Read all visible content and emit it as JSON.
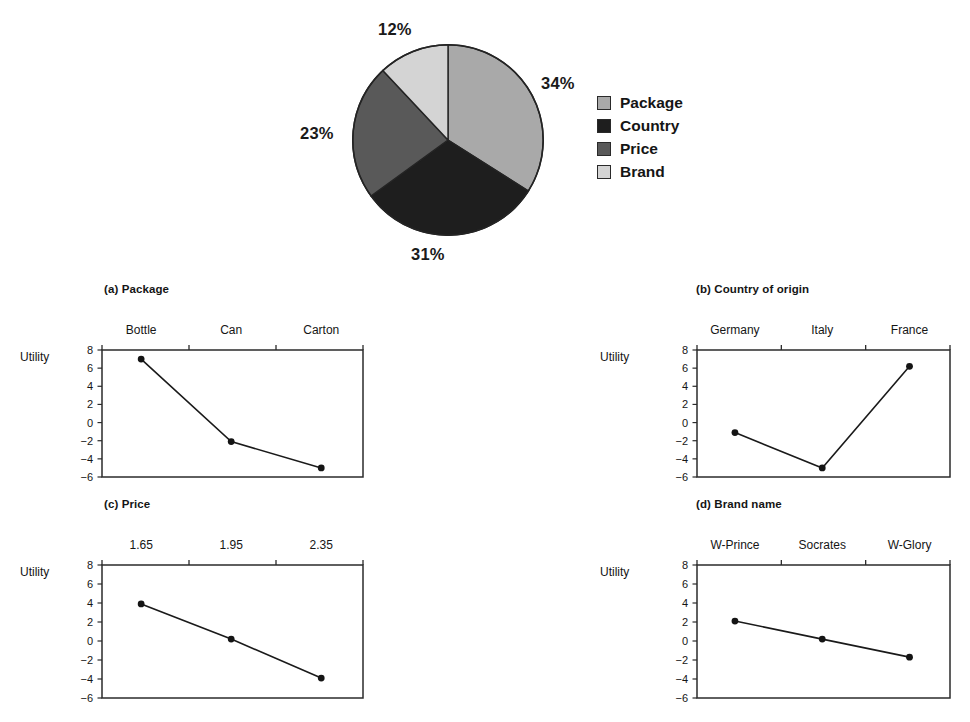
{
  "figure": {
    "pie_labels": {
      "package": "34%",
      "country": "31%",
      "price": "23%",
      "brand": "12%"
    },
    "legend": [
      {
        "label": "Package",
        "color": "#a9a9a9",
        "swatch_name": "legend-swatch-package"
      },
      {
        "label": "Country",
        "color": "#1e1e1e",
        "swatch_name": "legend-swatch-country"
      },
      {
        "label": "Price",
        "color": "#595959",
        "swatch_name": "legend-swatch-price"
      },
      {
        "label": "Brand",
        "color": "#d4d4d4",
        "swatch_name": "legend-swatch-brand"
      }
    ],
    "panels": {
      "a": {
        "title": "(a) Package",
        "ylabel": "Utility",
        "cats": [
          "Bottle",
          "Can",
          "Carton"
        ]
      },
      "b": {
        "title": "(b) Country of origin",
        "ylabel": "Utility",
        "cats": [
          "Germany",
          "Italy",
          "France"
        ]
      },
      "c": {
        "title": "(c) Price",
        "ylabel": "Utility",
        "cats": [
          "1.65",
          "1.95",
          "2.35"
        ]
      },
      "d": {
        "title": "(d) Brand name",
        "ylabel": "Utility",
        "cats": [
          "W-Prince",
          "Socrates",
          "W-Glory"
        ]
      }
    },
    "yticks": [
      "8",
      "6",
      "4",
      "2",
      "0",
      "-2",
      "-4",
      "-6"
    ]
  },
  "chart_data": [
    {
      "type": "pie",
      "title": "",
      "labels": [
        "Package",
        "Country",
        "Price",
        "Brand"
      ],
      "values": [
        34,
        31,
        23,
        12
      ],
      "value_labels": [
        "34%",
        "31%",
        "23%",
        "12%"
      ],
      "unit": "percent relative importance",
      "colors": [
        "#a9a9a9",
        "#1e1e1e",
        "#595959",
        "#d4d4d4"
      ],
      "start_angle_deg": 90,
      "direction": "clockwise",
      "legend_position": "right",
      "grid": false
    },
    {
      "type": "line",
      "title": "(a) Package",
      "xlabel": "",
      "ylabel": "Utility",
      "categories": [
        "Bottle",
        "Can",
        "Carton"
      ],
      "values": [
        7.0,
        -2.1,
        -5.0
      ],
      "ylim": [
        -6,
        8
      ],
      "yticks": [
        8,
        6,
        4,
        2,
        0,
        -2,
        -4,
        -6
      ],
      "grid": false,
      "markers": "filled-circle",
      "axis_position": "x-axis-on-top"
    },
    {
      "type": "line",
      "title": "(b) Country of origin",
      "xlabel": "",
      "ylabel": "Utility",
      "categories": [
        "Germany",
        "Italy",
        "France"
      ],
      "values": [
        -1.1,
        -5.0,
        6.2
      ],
      "ylim": [
        -6,
        8
      ],
      "yticks": [
        8,
        6,
        4,
        2,
        0,
        -2,
        -4,
        -6
      ],
      "grid": false,
      "markers": "filled-circle",
      "axis_position": "x-axis-on-top"
    },
    {
      "type": "line",
      "title": "(c) Price",
      "xlabel": "",
      "ylabel": "Utility",
      "categories": [
        "1.65",
        "1.95",
        "2.35"
      ],
      "values": [
        3.9,
        0.2,
        -3.9
      ],
      "ylim": [
        -6,
        8
      ],
      "yticks": [
        8,
        6,
        4,
        2,
        0,
        -2,
        -4,
        -6
      ],
      "grid": false,
      "markers": "filled-circle",
      "axis_position": "x-axis-on-top"
    },
    {
      "type": "line",
      "title": "(d) Brand name",
      "xlabel": "",
      "ylabel": "Utility",
      "categories": [
        "W-Prince",
        "Socrates",
        "W-Glory"
      ],
      "values": [
        2.1,
        0.2,
        -1.7
      ],
      "ylim": [
        -6,
        8
      ],
      "yticks": [
        8,
        6,
        4,
        2,
        0,
        -2,
        -4,
        -6
      ],
      "grid": false,
      "markers": "filled-circle",
      "axis_position": "x-axis-on-top"
    }
  ]
}
